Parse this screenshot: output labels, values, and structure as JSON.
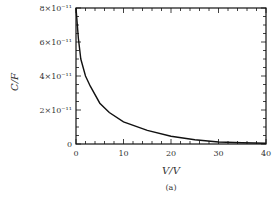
{
  "chart_data": {
    "type": "line",
    "title": "",
    "caption": "(a)",
    "xlabel": "V/V",
    "ylabel": "C/F",
    "xlim": [
      0,
      40
    ],
    "ylim": [
      0,
      8e-11
    ],
    "x_ticks": [
      "0",
      "10",
      "20",
      "30",
      "40"
    ],
    "y_ticks": [
      "0",
      "2×10⁻¹¹",
      "4×10⁻¹¹",
      "6×10⁻¹¹",
      "8×10⁻¹¹"
    ],
    "grid": false,
    "legend": null,
    "series": [
      {
        "name": "C(V)",
        "x": [
          0,
          0.5,
          1,
          2,
          3,
          5,
          7,
          10,
          15,
          20,
          25,
          30,
          35,
          40
        ],
        "y": [
          8e-11,
          6.2e-11,
          5e-11,
          4e-11,
          3.4e-11,
          2.4e-11,
          1.85e-11,
          1.3e-11,
          8e-12,
          4.5e-12,
          2.5e-12,
          1.2e-12,
          7e-13,
          5e-13
        ]
      }
    ]
  }
}
